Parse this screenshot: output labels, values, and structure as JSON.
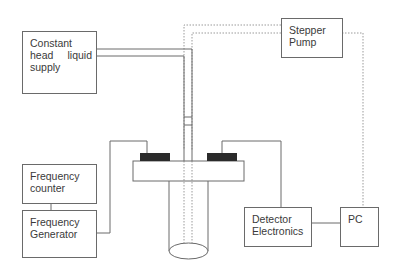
{
  "diagram": {
    "type": "experimental-setup-block-diagram",
    "colors": {
      "line": "#6a6a6a",
      "dashed_line": "#9a9a9a",
      "pad": "#2b2b2b",
      "text": "#3a3a3a",
      "background": "#ffffff"
    },
    "blocks": {
      "constant_head": {
        "line1": "Constant",
        "line2_left": "head",
        "line2_right": "liquid",
        "line3": "supply"
      },
      "stepper_pump": {
        "line1": "Stepper",
        "line2": "Pump"
      },
      "frequency_counter": {
        "line1": "Frequency",
        "line2": "counter"
      },
      "frequency_generator": {
        "line1": "Frequency",
        "line2": "Generator"
      },
      "detector_electronics": {
        "line1": "Detector",
        "line2": "Electronics"
      },
      "pc": {
        "line1": "PC"
      }
    },
    "connections": [
      {
        "from": "constant_head",
        "to": "flow-cell",
        "style": "double-line pipe"
      },
      {
        "from": "stepper_pump",
        "to": "flow-cell",
        "style": "dashed double line"
      },
      {
        "from": "stepper_pump",
        "to": "pc",
        "style": "dashed"
      },
      {
        "from": "frequency_counter",
        "to": "frequency_generator",
        "style": "solid"
      },
      {
        "from": "frequency_generator",
        "to": "left-transducer",
        "style": "solid"
      },
      {
        "from": "right-transducer",
        "to": "detector_electronics",
        "style": "solid"
      },
      {
        "from": "detector_electronics",
        "to": "pc",
        "style": "solid"
      }
    ]
  }
}
